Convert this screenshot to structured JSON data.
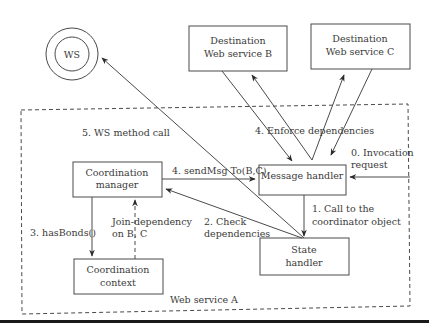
{
  "diagram": {
    "container_label": "Web service A",
    "ws_node": {
      "label": "WS"
    },
    "nodes": {
      "dest_b": {
        "line1": "Destination",
        "line2": "Web service B"
      },
      "dest_c": {
        "line1": "Destination",
        "line2": "Web service C"
      },
      "coord_manager": {
        "line1": "Coordination",
        "line2": "manager"
      },
      "message_handler": {
        "label": "Message handler"
      },
      "coord_context": {
        "line1": "Coordination",
        "line2": "context"
      },
      "state_handler": {
        "line1": "State",
        "line2": "handler"
      }
    },
    "edges": {
      "ws_call": "5. WS method call",
      "enforce": "4. Enforce dependencies",
      "invocation_1": "0. Invocation",
      "invocation_2": "request",
      "send_msg": "4. sendMsg To(B,C)",
      "call_coord_1": "1. Call to the",
      "call_coord_2": "coordinator object",
      "has_bonds": "3. hasBonds()",
      "join_dep_1": "Join-dependency",
      "join_dep_2": "on B, C",
      "check_dep_1": "2. Check",
      "check_dep_2": "dependencies"
    }
  }
}
